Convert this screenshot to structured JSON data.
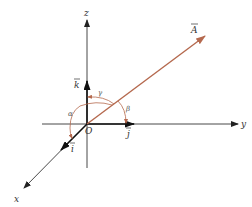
{
  "diagram": {
    "axes": {
      "x": "x",
      "y": "y",
      "z": "z"
    },
    "origin": "O",
    "vector": "A",
    "unit_vectors": {
      "i": "i",
      "j": "j",
      "k": "k"
    },
    "angles": {
      "alpha": "α",
      "beta": "β",
      "gamma": "γ"
    },
    "colors": {
      "axes": "#222222",
      "vector": "#b5694e",
      "angle_arcs": "#b5694e"
    }
  }
}
